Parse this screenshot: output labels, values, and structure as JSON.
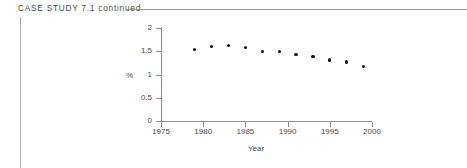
{
  "header": {
    "label": "CASE  STUDY  7.1  continued"
  },
  "chart_data": {
    "type": "scatter",
    "title": "",
    "xlabel": "Year",
    "ylabel": "%",
    "x": [
      1979,
      1981,
      1983,
      1985,
      1987,
      1989,
      1991,
      1993,
      1995,
      1997,
      1999
    ],
    "values": [
      1.54,
      1.61,
      1.62,
      1.58,
      1.5,
      1.5,
      1.43,
      1.39,
      1.31,
      1.27,
      1.17
    ],
    "xlim": [
      1975,
      2000
    ],
    "ylim": [
      0,
      2
    ],
    "xticks": [
      1975,
      1980,
      1985,
      1990,
      1995,
      2000
    ],
    "xtick_labels": [
      "1975",
      "1980",
      "1985",
      "1990",
      "1995",
      "2000"
    ],
    "yticks": [
      0,
      0.5,
      1,
      1.5,
      2
    ],
    "ytick_labels": [
      "0",
      "0.5",
      "1",
      "1.5",
      "2"
    ],
    "grid": false,
    "legend": null,
    "marker_color": "#111111"
  }
}
